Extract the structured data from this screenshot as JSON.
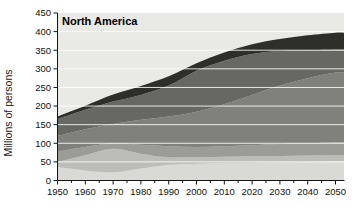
{
  "figure": {
    "background": "#ffffff"
  },
  "chart_data": {
    "type": "area",
    "stacked": true,
    "title": "North America",
    "ylabel": "Millions of persons",
    "xlabel": "",
    "legend": "none",
    "x": [
      1950,
      1960,
      1970,
      1980,
      1990,
      2000,
      2010,
      2020,
      2030,
      2040,
      2050
    ],
    "x_tick_labels": [
      "1950",
      "1960",
      "1970",
      "1980",
      "1990",
      "2000",
      "2010",
      "2020",
      "2030",
      "2040",
      "2050"
    ],
    "y_ticks": [
      0,
      50,
      100,
      150,
      200,
      250,
      300,
      350,
      400,
      450
    ],
    "ylim": [
      0,
      450
    ],
    "xlim": [
      1950,
      2050
    ],
    "x_minor_tick_step": 5,
    "grid": "horizontal",
    "gridline_color": "#ffffff",
    "plot_background": "#e9e9e6",
    "axis_color": "#141414",
    "series": [
      {
        "name": "band-1",
        "color": "#d9d9d5",
        "values": [
          36,
          27,
          22,
          32,
          42,
          45,
          47,
          48,
          49,
          50,
          51
        ]
      },
      {
        "name": "band-2",
        "color": "#bcbcb8",
        "values": [
          14,
          41,
          63,
          40,
          20,
          18,
          17,
          17,
          17,
          17,
          17
        ]
      },
      {
        "name": "band-3",
        "color": "#9b9b97",
        "values": [
          28,
          22,
          15,
          24,
          30,
          27,
          28,
          30,
          32,
          33,
          34
        ]
      },
      {
        "name": "band-4",
        "color": "#80807c",
        "values": [
          42,
          48,
          52,
          67,
          80,
          95,
          113,
          135,
          157,
          175,
          188
        ]
      },
      {
        "name": "band-5",
        "color": "#676763",
        "values": [
          45,
          52,
          60,
          67,
          83,
          110,
          117,
          110,
          93,
          75,
          62
        ]
      },
      {
        "name": "band-6",
        "color": "#2e2e2b",
        "values": [
          7,
          11,
          19,
          24,
          25,
          20,
          22,
          26,
          32,
          40,
          45
        ]
      }
    ],
    "totals": [
      172,
      201,
      231,
      254,
      280,
      315,
      344,
      366,
      380,
      390,
      397
    ]
  }
}
